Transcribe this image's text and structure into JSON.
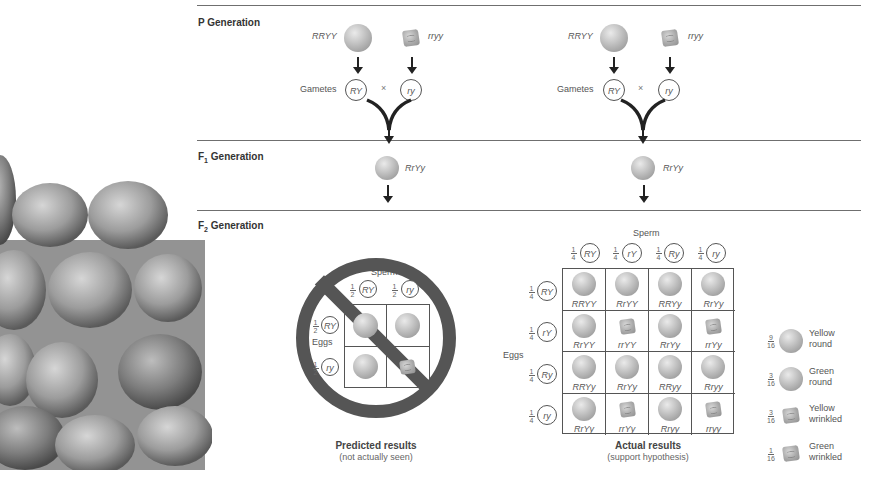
{
  "sections": {
    "p_generation": {
      "label": "P Generation"
    },
    "f1_generation": {
      "label": "F",
      "sub": "1",
      "suffix": " Generation"
    },
    "f2_generation": {
      "label": "F",
      "sub": "2",
      "suffix": " Generation"
    }
  },
  "p_cross": {
    "left": {
      "parent1_genotype": "RRYY",
      "parent2_genotype": "rryy",
      "gametes_label": "Gametes",
      "gamete1": "RY",
      "gamete2": "ry",
      "cross_symbol": "×"
    },
    "right": {
      "parent1_genotype": "RRYY",
      "parent2_genotype": "rryy",
      "gametes_label": "Gametes",
      "gamete1": "RY",
      "gamete2": "ry",
      "cross_symbol": "×"
    }
  },
  "f1": {
    "left_genotype": "RrYy",
    "right_genotype": "RrYy"
  },
  "predicted": {
    "sperm_label": "Sperm",
    "eggs_label": "Eggs",
    "fraction": {
      "num": "1",
      "den": "2"
    },
    "sperm": [
      "RY",
      "ry"
    ],
    "eggs": [
      "RY",
      "ry"
    ],
    "cells": [
      [
        "round",
        "round"
      ],
      [
        "round",
        "wrinkled"
      ]
    ],
    "caption_bold": "Predicted results",
    "caption_note": "(not actually seen)"
  },
  "actual": {
    "sperm_label": "Sperm",
    "eggs_label": "Eggs",
    "fraction": {
      "num": "1",
      "den": "4"
    },
    "sperm": [
      "RY",
      "rY",
      "Ry",
      "ry"
    ],
    "eggs": [
      "RY",
      "rY",
      "Ry",
      "ry"
    ],
    "cells": [
      [
        {
          "g": "RRYY",
          "s": "round"
        },
        {
          "g": "RrYY",
          "s": "round"
        },
        {
          "g": "RRYy",
          "s": "round"
        },
        {
          "g": "RrYy",
          "s": "round"
        }
      ],
      [
        {
          "g": "RrYY",
          "s": "round"
        },
        {
          "g": "rrYY",
          "s": "wrinkled"
        },
        {
          "g": "RrYy",
          "s": "round"
        },
        {
          "g": "rrYy",
          "s": "wrinkled"
        }
      ],
      [
        {
          "g": "RRYy",
          "s": "round"
        },
        {
          "g": "RrYy",
          "s": "round"
        },
        {
          "g": "RRyy",
          "s": "round"
        },
        {
          "g": "Rryy",
          "s": "round"
        }
      ],
      [
        {
          "g": "RrYy",
          "s": "round"
        },
        {
          "g": "rrYy",
          "s": "wrinkled"
        },
        {
          "g": "Rryy",
          "s": "round"
        },
        {
          "g": "rryy",
          "s": "wrinkled"
        }
      ]
    ],
    "caption_bold": "Actual results",
    "caption_note": "(support hypothesis)"
  },
  "legend": [
    {
      "num": "9",
      "den": "16",
      "line1": "Yellow",
      "line2": "round",
      "shape": "round"
    },
    {
      "num": "3",
      "den": "16",
      "line1": "Green",
      "line2": "round",
      "shape": "round"
    },
    {
      "num": "3",
      "den": "16",
      "line1": "Yellow",
      "line2": "wrinkled",
      "shape": "wrinkled"
    },
    {
      "num": "1",
      "den": "16",
      "line1": "Green",
      "line2": "wrinkled",
      "shape": "wrinkled"
    }
  ]
}
